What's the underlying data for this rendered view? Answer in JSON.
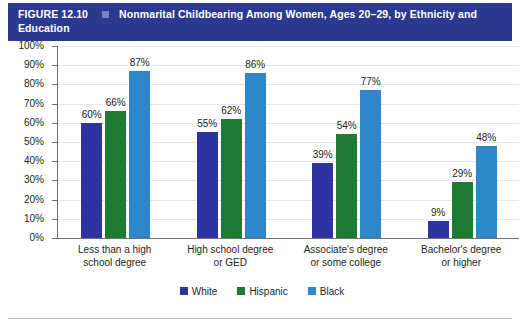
{
  "header": {
    "figure_label": "FIGURE 12.10",
    "marker_icon": "square-marker-icon",
    "title_line1": "Nonmarital Childbearing Among Women, Ages 20–29, by Ethnicity and",
    "title_line2": "Education",
    "bar_color": "#2b3a8f",
    "marker_color": "#6f86c8"
  },
  "chart_data": {
    "type": "bar",
    "title": "Nonmarital Childbearing Among Women, Ages 20–29, by Ethnicity and Education",
    "categories": [
      "Less than a high school degree",
      "High school degree or GED",
      "Associate's degree or some college",
      "Bachelor's degree or higher"
    ],
    "category_lines": [
      [
        "Less than a high",
        "school degree"
      ],
      [
        "High school degree",
        "or GED"
      ],
      [
        "Associate's degree",
        "or some college"
      ],
      [
        "Bachelor's degree",
        "or higher"
      ]
    ],
    "series": [
      {
        "name": "White",
        "color": "#2f33a0",
        "values": [
          60,
          55,
          39,
          9
        ],
        "labels": [
          "60%",
          "55%",
          "39%",
          "9%"
        ]
      },
      {
        "name": "Hispanic",
        "color": "#1f7a33",
        "values": [
          66,
          62,
          54,
          29
        ],
        "labels": [
          "66%",
          "62%",
          "54%",
          "29%"
        ]
      },
      {
        "name": "Black",
        "color": "#2f86c8",
        "values": [
          87,
          86,
          77,
          48
        ],
        "labels": [
          "87%",
          "86%",
          "77%",
          "48%"
        ]
      }
    ],
    "xlabel": "",
    "ylabel": "",
    "ylim": [
      0,
      100
    ],
    "ytick_values": [
      100,
      90,
      80,
      70,
      60,
      50,
      40,
      30,
      20,
      10,
      0
    ],
    "ytick_labels": [
      "100%",
      "90%",
      "80%",
      "70%",
      "60%",
      "50%",
      "40%",
      "30%",
      "20%",
      "10%",
      "0%"
    ],
    "grid": true,
    "legend_position": "bottom"
  }
}
